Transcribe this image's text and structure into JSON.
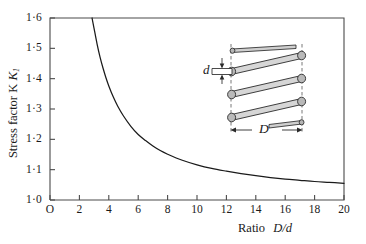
{
  "chart_data": {
    "type": "line",
    "title": "",
    "xlabel": "Ratio D/d",
    "ylabel": "Stress factor K",
    "ylabel_sub": "1",
    "xlim": [
      0,
      20
    ],
    "ylim": [
      1.0,
      1.6
    ],
    "grid": false,
    "legend": null,
    "xticks": [
      0,
      2,
      4,
      6,
      8,
      10,
      12,
      14,
      16,
      18,
      20
    ],
    "xticklabels": [
      "O",
      "2",
      "4",
      "6",
      "8",
      "10",
      "12",
      "14",
      "16",
      "18",
      "20"
    ],
    "yticks": [
      1.0,
      1.1,
      1.2,
      1.3,
      1.4,
      1.5,
      1.6
    ],
    "yticklabels": [
      "1·0",
      "1·1",
      "1·2",
      "1·3",
      "1·4",
      "1·5",
      "1·6"
    ],
    "series": [
      {
        "name": "Wahl stress factor",
        "color": "#1a1a1a",
        "x": [
          2.86,
          3.0,
          3.2,
          3.4,
          3.6,
          3.8,
          4.0,
          4.3,
          4.6,
          5.0,
          5.5,
          6.0,
          6.5,
          7.0,
          7.5,
          8.0,
          9.0,
          10.0,
          11.0,
          12.0,
          13.0,
          14.0,
          15.0,
          16.0,
          17.0,
          18.0,
          19.0,
          20.0
        ],
        "y": [
          1.6,
          1.565,
          1.515,
          1.472,
          1.436,
          1.404,
          1.376,
          1.34,
          1.31,
          1.277,
          1.243,
          1.216,
          1.196,
          1.178,
          1.163,
          1.151,
          1.131,
          1.116,
          1.104,
          1.095,
          1.087,
          1.08,
          1.074,
          1.069,
          1.065,
          1.061,
          1.058,
          1.055
        ]
      }
    ]
  },
  "inset": {
    "name": "helical-spring-diagram",
    "wire_label": "d",
    "diameter_label": "D",
    "coil_count": 4,
    "wire_color": "#b8b8b8",
    "outline_color": "#2a2a2a",
    "dashed_color": "#4a4a4a"
  },
  "axes": {
    "frame_color": "#4a4a4a",
    "curve_color": "#1a1a1a",
    "background": "#ffffff"
  }
}
